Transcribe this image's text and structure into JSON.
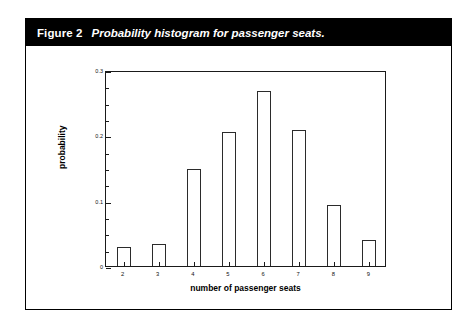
{
  "figure": {
    "label": "Figure 2",
    "caption": "Probability histogram for passenger seats."
  },
  "chart_data": {
    "type": "bar",
    "title": "Probability histogram for passenger seats.",
    "xlabel": "number of passenger seats",
    "ylabel": "probability",
    "categories": [
      "2",
      "3",
      "4",
      "5",
      "6",
      "7",
      "8",
      "9"
    ],
    "values": [
      0.029,
      0.034,
      0.148,
      0.205,
      0.268,
      0.208,
      0.094,
      0.04
    ],
    "ylim": [
      0,
      0.3
    ],
    "ytick_labels": [
      "0",
      "0.1",
      "0.2",
      "0.3"
    ],
    "ytick_values": [
      0,
      0.1,
      0.2,
      0.3
    ],
    "yminor_step": 0.025,
    "xtick_labels": [
      "2",
      "3",
      "4",
      "5",
      "6",
      "7",
      "8",
      "9"
    ],
    "grid": false,
    "legend": null,
    "bar_fill": "#ffffff",
    "bar_edge": "#2b2b2b",
    "frame_color": "#1a1a1a"
  },
  "style": {
    "caption_bar_bg": "#000000",
    "caption_text_color": "#ffffff",
    "page_bg": "#ffffff",
    "border_color": "#000000"
  }
}
